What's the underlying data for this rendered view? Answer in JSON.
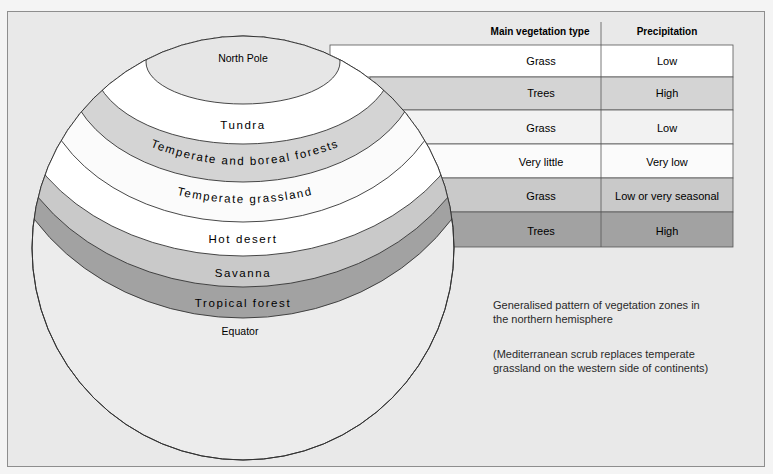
{
  "table": {
    "headers": [
      "Main vegetation type",
      "Precipitation"
    ],
    "rows": [
      {
        "vegetation": "Grass",
        "precipitation": "Low",
        "fill": "#ffffff"
      },
      {
        "vegetation": "Trees",
        "precipitation": "High",
        "fill": "#d4d4d4"
      },
      {
        "vegetation": "Grass",
        "precipitation": "Low",
        "fill": "#f2f2f2"
      },
      {
        "vegetation": "Very little",
        "precipitation": "Very low",
        "fill": "#fbfbfb"
      },
      {
        "vegetation": "Grass",
        "precipitation": "Low or very seasonal",
        "fill": "#c9c9c9"
      },
      {
        "vegetation": "Trees",
        "precipitation": "High",
        "fill": "#a2a2a2"
      }
    ]
  },
  "globe": {
    "pole_label": "North Pole",
    "equator_label": "Equator",
    "bands": [
      {
        "label": "Tundra",
        "fill": "#ffffff"
      },
      {
        "label": "Temperate and boreal forests",
        "fill": "#d4d4d4"
      },
      {
        "label": "Temperate grassland",
        "fill": "#fbfbfb"
      },
      {
        "label": "Hot desert",
        "fill": "#ffffff"
      },
      {
        "label": "Savanna",
        "fill": "#c9c9c9"
      },
      {
        "label": "Tropical forest",
        "fill": "#a2a2a2"
      }
    ],
    "pole_fill": "#e6e6e6",
    "lower_fill": "#ececec"
  },
  "captions": {
    "title_line1": "Generalised pattern of vegetation zones in",
    "title_line2": "the northern hemisphere",
    "note_line1": "(Mediterranean scrub replaces temperate",
    "note_line2": "grassland on the western side of continents)"
  }
}
